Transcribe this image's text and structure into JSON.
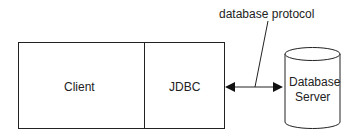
{
  "diagram": {
    "client": {
      "label": "Client"
    },
    "driver": {
      "label": "JDBC"
    },
    "server": {
      "line1": "Database",
      "line2": "Server"
    },
    "connection": {
      "label": "database protocol"
    }
  }
}
